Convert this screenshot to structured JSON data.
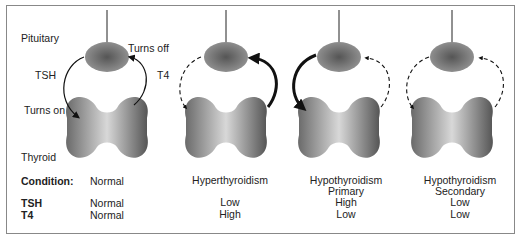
{
  "labels": {
    "pituitary": "Pituitary",
    "thyroid": "Thyroid",
    "tsh_arrow": "TSH",
    "t4_arrow": "T4",
    "turns_on": "Turns on",
    "turns_off": "Turns off"
  },
  "rows": {
    "condition": "Condition:",
    "tsh": "TSH",
    "t4": "T4"
  },
  "columns": [
    {
      "condition": "Normal",
      "condition_sub": "",
      "tsh": "Normal",
      "t4": "Normal"
    },
    {
      "condition": "Hyperthyroidism",
      "condition_sub": "",
      "tsh": "Low",
      "t4": "High"
    },
    {
      "condition": "Hypothyroidism",
      "condition_sub": "Primary",
      "tsh": "High",
      "t4": "Low"
    },
    {
      "condition": "Hypothyroidism",
      "condition_sub": "Secondary",
      "tsh": "Low",
      "t4": "Low"
    }
  ]
}
